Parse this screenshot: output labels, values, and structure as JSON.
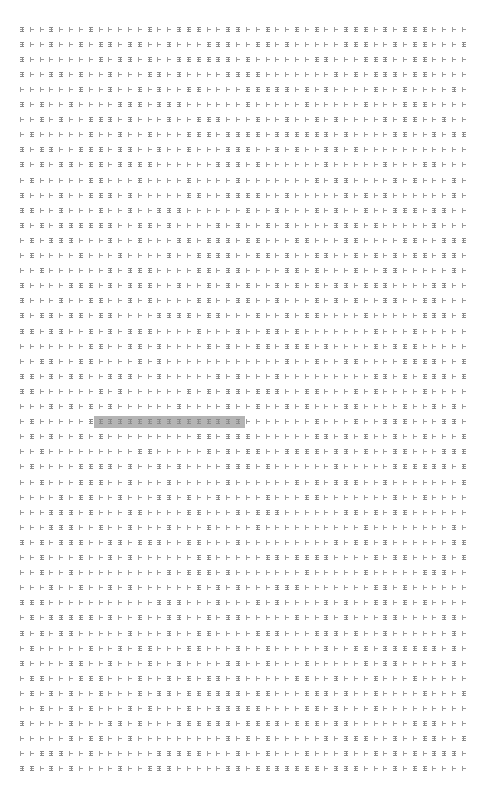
{
  "grid": {
    "rows": 50,
    "cols": 46,
    "origin_x": 22,
    "origin_y": 29,
    "col_spacing": 9.82,
    "row_spacing": 15.1,
    "glyph_legend": {
      "I": "i-beam-glyph",
      "T": "tee-glyph"
    },
    "known_rows": {
      "0": "ITTITTTITTTTTITTIIITTIITTITTITITTIIITITIIITTTT",
      "1": "ITTITTITIITIITTITTTIIITTIITITTTTTIIITTITIITTTI"
    },
    "seed": 1337
  },
  "highlight": {
    "row": 26,
    "col_start": 8,
    "col_end": 22,
    "color": "#b4b4b4",
    "glyph": "I"
  },
  "colors": {
    "background": "#ffffff",
    "glyph": "#8a8a8a"
  }
}
